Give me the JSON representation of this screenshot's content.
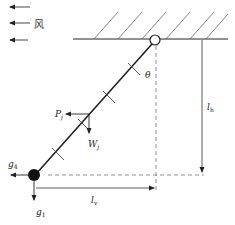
{
  "diagram": {
    "type": "mechanics-free-body",
    "colors": {
      "line": "#222222",
      "dashed": "#777777",
      "hatch": "#555555",
      "ball": "#111111"
    },
    "wind": {
      "label": "风",
      "arrow_count": 3,
      "direction": "left"
    },
    "labels": {
      "theta": "θ",
      "P": "P",
      "P_sub": "j",
      "W": "W",
      "W_sub": "j",
      "g4": "g",
      "g4_sub": "4",
      "g1": "g",
      "g1_sub": "1",
      "lh": "l",
      "lh_sub": "h",
      "lv": "l",
      "lv_sub": "v"
    },
    "elements": {
      "support": "hatched-ceiling",
      "hinge": "open-circle",
      "rod": "inclined-insulator-string",
      "end_mass": "solid-ball"
    }
  }
}
